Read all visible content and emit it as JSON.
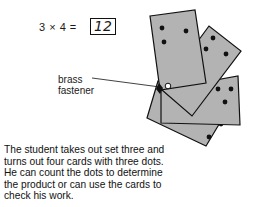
{
  "equation": {
    "expression": "3 × 4 =",
    "answer": "12"
  },
  "label": {
    "line1": "brass",
    "line2": "fastener"
  },
  "caption": "The student takes out set three and turns out four cards with three dots. He can count the dots to determine the product or can use the cards to check his work.",
  "illustration": {
    "card_count": 4,
    "dots_per_card": 3,
    "card_fill": "#b3b3b3",
    "outline": "#111111"
  }
}
